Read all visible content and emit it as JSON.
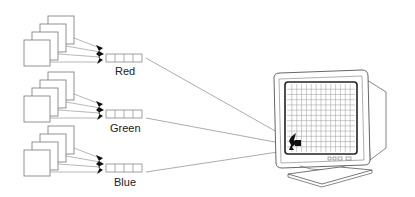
{
  "diagram": {
    "title": "",
    "channels": [
      {
        "label": "Red",
        "y": 58
      },
      {
        "label": "Green",
        "y": 118
      },
      {
        "label": "Blue",
        "y": 170
      }
    ],
    "display": {
      "type": "crt-monitor",
      "grid_cols": 14,
      "grid_rows": 13
    },
    "colors": {
      "stroke": "#555555",
      "line": "#888888",
      "dark": "#111111",
      "screen_border": "#333333"
    }
  }
}
